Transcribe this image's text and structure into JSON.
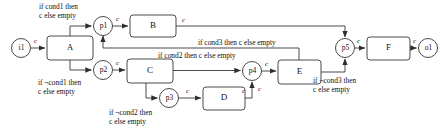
{
  "diagram": {
    "kind": "dataflow-process-diagram",
    "stroke_color": "#3a3a3a",
    "fill_color": "#ffffff",
    "background": "#ffffff",
    "places": [
      {
        "id": "i1",
        "label": "i1",
        "cx": 21,
        "cy": 48,
        "r": 9.5
      },
      {
        "id": "p1",
        "label": "p1",
        "cx": 103,
        "cy": 26,
        "r": 9.5
      },
      {
        "id": "p2",
        "label": "p2",
        "cx": 103,
        "cy": 70,
        "r": 9.5
      },
      {
        "id": "p3",
        "label": "p3",
        "cx": 169,
        "cy": 98,
        "r": 9.5
      },
      {
        "id": "p4",
        "label": "p4",
        "cx": 252,
        "cy": 71,
        "r": 9.5
      },
      {
        "id": "p5",
        "label": "p5",
        "cx": 345,
        "cy": 48,
        "r": 9.5
      },
      {
        "id": "o1",
        "label": "o1",
        "cx": 428,
        "cy": 48,
        "r": 9.5
      }
    ],
    "boxes": [
      {
        "id": "A",
        "label": "A",
        "x": 47,
        "y": 36,
        "w": 46,
        "h": 24
      },
      {
        "id": "B",
        "label": "B",
        "x": 130,
        "y": 15,
        "w": 46,
        "h": 22
      },
      {
        "id": "C",
        "label": "C",
        "x": 127,
        "y": 59,
        "w": 46,
        "h": 24
      },
      {
        "id": "D",
        "label": "D",
        "x": 203,
        "y": 87,
        "w": 42,
        "h": 23
      },
      {
        "id": "E",
        "label": "E",
        "x": 278,
        "y": 60,
        "w": 43,
        "h": 24
      },
      {
        "id": "F",
        "label": "F",
        "x": 367,
        "y": 37,
        "w": 43,
        "h": 23
      }
    ],
    "edge_labels": [
      {
        "text": "c",
        "x": 34,
        "y": 38
      },
      {
        "text": "c",
        "x": 116,
        "y": 16
      },
      {
        "text": "c",
        "x": 182,
        "y": 17
      },
      {
        "text": "c",
        "x": 116,
        "y": 60
      },
      {
        "text": "c",
        "x": 182,
        "y": 89
      },
      {
        "text": "c",
        "x": 244,
        "y": 88
      },
      {
        "text": "c",
        "x": 178,
        "y": 100
      },
      {
        "text": "c",
        "x": 265,
        "y": 61
      },
      {
        "text": "c",
        "x": 357,
        "y": 38
      },
      {
        "text": "c",
        "x": 414,
        "y": 38
      }
    ],
    "guards": [
      {
        "id": "guard-cond1",
        "lines": [
          "if cond1 then",
          "c else empty"
        ],
        "x": 39,
        "y": 2
      },
      {
        "id": "guard-not-cond1",
        "lines": [
          "if ¬cond1 then",
          "c else empty"
        ],
        "x": 38,
        "y": 78
      },
      {
        "id": "guard-cond2",
        "lines": [
          "if cond2 then c else empty"
        ],
        "x": 158,
        "y": 51
      },
      {
        "id": "guard-not-cond2",
        "lines": [
          "if ¬cond2 then",
          "c else empty"
        ],
        "x": 109,
        "y": 108
      },
      {
        "id": "guard-cond3",
        "lines": [
          "if cond3 then c else empty"
        ],
        "x": 198,
        "y": 38
      },
      {
        "id": "guard-not-cond3",
        "lines": [
          "if ¬cond3 then",
          "c else empty"
        ],
        "x": 313,
        "y": 76
      }
    ]
  }
}
